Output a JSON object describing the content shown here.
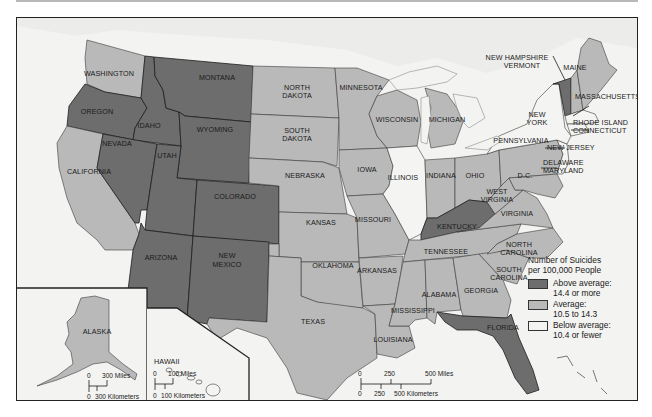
{
  "map": {
    "title": "Number of Suicides per 100,000 People",
    "colors": {
      "above_average": "#6d6d6d",
      "average": "#b9b9b9",
      "below_average": "#f4f4f2",
      "water": "#f3f3f1"
    },
    "legend": {
      "title_line1": "Number of Suicides",
      "title_line2": "per 100,000 People",
      "items": [
        {
          "key": "above_average",
          "label": "Above average:",
          "range": "14.4 or more",
          "color": "#6d6d6d"
        },
        {
          "key": "average",
          "label": "Average:",
          "range": "10.5 to 14.3",
          "color": "#b9b9b9"
        },
        {
          "key": "below_average",
          "label": "Below average:",
          "range": "10.4 or fewer",
          "color": "#f4f4f2"
        }
      ]
    },
    "states": {
      "washington": {
        "name": "WASHINGTON",
        "category": "average"
      },
      "oregon": {
        "name": "OREGON",
        "category": "above_average"
      },
      "california": {
        "name": "CALIFORNIA",
        "category": "average"
      },
      "idaho": {
        "name": "IDAHO",
        "category": "above_average"
      },
      "nevada": {
        "name": "NEVADA",
        "category": "above_average"
      },
      "montana": {
        "name": "MONTANA",
        "category": "above_average"
      },
      "wyoming": {
        "name": "WYOMING",
        "category": "above_average"
      },
      "utah": {
        "name": "UTAH",
        "category": "above_average"
      },
      "colorado": {
        "name": "COLORADO",
        "category": "above_average"
      },
      "arizona": {
        "name": "ARIZONA",
        "category": "above_average"
      },
      "new_mexico": {
        "name_line1": "NEW",
        "name_line2": "MEXICO",
        "category": "above_average"
      },
      "north_dakota": {
        "name_line1": "NORTH",
        "name_line2": "DAKOTA",
        "category": "average"
      },
      "south_dakota": {
        "name_line1": "SOUTH",
        "name_line2": "DAKOTA",
        "category": "average"
      },
      "nebraska": {
        "name": "NEBRASKA",
        "category": "average"
      },
      "kansas": {
        "name": "KANSAS",
        "category": "average"
      },
      "oklahoma": {
        "name": "OKLAHOMA",
        "category": "average"
      },
      "texas": {
        "name": "TEXAS",
        "category": "average"
      },
      "minnesota": {
        "name": "MINNESOTA",
        "category": "average"
      },
      "iowa": {
        "name": "IOWA",
        "category": "average"
      },
      "missouri": {
        "name": "MISSOURI",
        "category": "average"
      },
      "arkansas": {
        "name": "ARKANSAS",
        "category": "average"
      },
      "louisiana": {
        "name": "LOUISIANA",
        "category": "average"
      },
      "wisconsin": {
        "name": "WISCONSIN",
        "category": "average"
      },
      "illinois": {
        "name": "ILLINOIS",
        "category": "below_average"
      },
      "michigan": {
        "name": "MICHIGAN",
        "category": "average"
      },
      "indiana": {
        "name": "INDIANA",
        "category": "average"
      },
      "ohio": {
        "name": "OHIO",
        "category": "average"
      },
      "kentucky": {
        "name": "KENTUCKY",
        "category": "above_average"
      },
      "tennessee": {
        "name": "TENNESSEE",
        "category": "average"
      },
      "mississippi": {
        "name": "MISSISSIPPI",
        "category": "average"
      },
      "alabama": {
        "name": "ALABAMA",
        "category": "average"
      },
      "georgia": {
        "name": "GEORGIA",
        "category": "average"
      },
      "florida": {
        "name": "FLORIDA",
        "category": "above_average"
      },
      "south_carolina": {
        "name_line1": "SOUTH",
        "name_line2": "CAROLINA",
        "category": "average"
      },
      "north_carolina": {
        "name_line1": "NORTH",
        "name_line2": "CAROLINA",
        "category": "average"
      },
      "virginia": {
        "name": "VIRGINIA",
        "category": "average"
      },
      "west_virginia": {
        "name_line1": "WEST",
        "name_line2": "VIRGINIA",
        "category": "average"
      },
      "dc": {
        "name": "D.C.",
        "category": "average"
      },
      "pennsylvania": {
        "name": "PENNSYLVANIA",
        "category": "average"
      },
      "new_york": {
        "name_line1": "NEW",
        "name_line2": "YORK",
        "category": "below_average"
      },
      "vermont": {
        "name": "VERMONT",
        "category": "above_average"
      },
      "new_hampshire": {
        "name": "NEW HAMPSHIRE",
        "category": "average"
      },
      "maine": {
        "name": "MAINE",
        "category": "average"
      },
      "massachusetts": {
        "name": "MASSACHUSETTS",
        "category": "below_average"
      },
      "rhode_island": {
        "name": "RHODE ISLAND",
        "category": "below_average"
      },
      "connecticut": {
        "name": "CONNECTICUT",
        "category": "below_average"
      },
      "new_jersey": {
        "name": "NEW JERSEY",
        "category": "below_average"
      },
      "delaware": {
        "name": "DELAWARE",
        "category": "average"
      },
      "maryland": {
        "name": "MARYLAND",
        "category": "average"
      },
      "alaska": {
        "name": "ALASKA",
        "category": "average"
      },
      "hawaii": {
        "name": "HAWAII",
        "category": "below_average"
      }
    },
    "scale_main": {
      "miles": [
        "0",
        "250",
        "500 Miles"
      ],
      "kilometers": [
        "0",
        "250",
        "500 Kilometers"
      ]
    },
    "scale_alaska": {
      "miles": [
        "0",
        "300 Miles"
      ],
      "kilometers": [
        "0",
        "300 Kilometers"
      ]
    },
    "scale_hawaii": {
      "miles": [
        "0",
        "100 Miles"
      ],
      "kilometers": [
        "0",
        "100 Kilometers"
      ]
    }
  }
}
